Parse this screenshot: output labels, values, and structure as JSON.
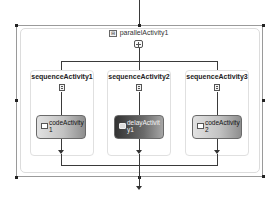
{
  "diagram": {
    "parallel": {
      "label": "parallelActivity1",
      "collapse_icon": "⊟",
      "icon": "parallel-icon"
    },
    "branches": [
      {
        "label": "sequenceActivity1",
        "icon": "sequence-icon",
        "activity": {
          "type": "code",
          "label": "codeActivity\n1",
          "icon": "code-icon"
        }
      },
      {
        "label": "sequenceActivity2",
        "icon": "sequence-icon",
        "activity": {
          "type": "delay",
          "label": "delayActivit\ny1",
          "icon": "delay-icon",
          "selected": true
        }
      },
      {
        "label": "sequenceActivity3",
        "icon": "sequence-icon",
        "activity": {
          "type": "code",
          "label": "codeActivity\n2",
          "icon": "code-icon"
        }
      }
    ],
    "colors": {
      "line": "#3a3a3a",
      "code_activity_gradient": [
        "#e2e2e2",
        "#8e8e8e"
      ],
      "delay_activity_gradient": [
        "#333333",
        "#a6a6a6"
      ]
    }
  }
}
